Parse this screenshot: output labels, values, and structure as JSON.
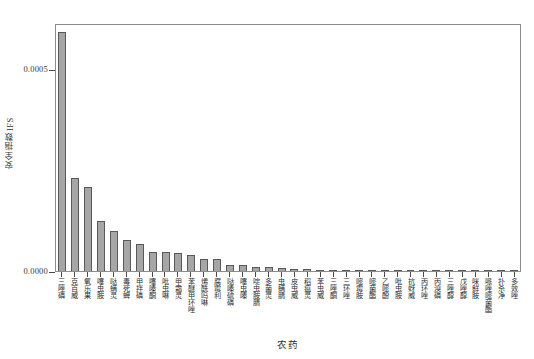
{
  "figure": {
    "background": "#ffffff",
    "bar_fill": "#a6a6a6",
    "bar_edge": "#595959",
    "axis_color": "#8c8c8c"
  },
  "axes": {
    "ylabel": "安全指数IFS",
    "xlabel": "农药",
    "ytick_labels": [
      "0.0000",
      "0.0005"
    ],
    "ytick_values": [
      0.0,
      0.0005
    ],
    "ylim": [
      0.0,
      0.000615
    ],
    "grid": "off",
    "legend": "none"
  },
  "chart_data": {
    "type": "bar",
    "title": "",
    "subtitle": "",
    "xlabel": "农药",
    "ylabel": "安全指数IFS",
    "ylim": [
      0.0,
      0.000615
    ],
    "ytick_labels": [
      "0.0000",
      "0.0005"
    ],
    "ytick_values": [
      0.0,
      0.0005
    ],
    "grid": false,
    "legend_position": "none",
    "annotations": [],
    "categories": [
      "三唑磷",
      "克百威",
      "氧乐果",
      "噻虫胺",
      "哒螨灵",
      "毒死蜱",
      "甲拌磷",
      "噻嗪酮",
      "吡虫啉",
      "甲霜灵",
      "苯醚甲环唑",
      "烯酰吗啉",
      "腐霉利",
      "哒嗪硫磷",
      "噻虫嗪",
      "啶虫胺腈",
      "多菌灵",
      "虫螨腈",
      "皮虫威",
      "稻瘟灵",
      "苯虫威",
      "三唑酮",
      "三环唑",
      "嘧霉胺",
      "嘧菌酯",
      "乙嘧酚",
      "吡虫胺",
      "抗蚜威",
      "丙环唑",
      "丙溴磷",
      "三唑醇",
      "戊唑醇",
      "咪鲜胺",
      "哌唑嘧菌酯",
      "扑杀净",
      "多效唑"
    ],
    "values": [
      0.000592,
      0.000231,
      0.000209,
      0.000124,
      9.9e-05,
      7.6e-05,
      6.7e-05,
      4.8e-05,
      4.6e-05,
      4.5e-05,
      3.9e-05,
      3e-05,
      2.9e-05,
      1.6e-05,
      1.5e-05,
      1.1e-05,
      9e-06,
      7e-06,
      5e-06,
      4e-06,
      3.5e-06,
      3e-06,
      2.5e-06,
      2e-06,
      2e-06,
      1.5e-06,
      1.5e-06,
      1e-06,
      1e-06,
      1e-06,
      8e-07,
      7e-07,
      6e-07,
      5e-07,
      4e-07,
      3e-07
    ]
  }
}
